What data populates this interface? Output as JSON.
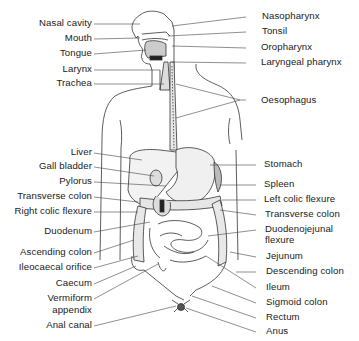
{
  "figure": {
    "left_labels": [
      {
        "text": "Nasal cavity",
        "y": 17
      },
      {
        "text": "Mouth",
        "y": 32
      },
      {
        "text": "Tongue",
        "y": 47
      },
      {
        "text": "Larynx",
        "y": 63
      },
      {
        "text": "Trachea",
        "y": 77
      },
      {
        "text": "Liver",
        "y": 146
      },
      {
        "text": "Gall bladder",
        "y": 160
      },
      {
        "text": "Pylorus",
        "y": 175
      },
      {
        "text": "Transverse colon",
        "y": 190
      },
      {
        "text": "Right colic flexure",
        "y": 205
      },
      {
        "text": "Duodenum",
        "y": 225
      },
      {
        "text": "Ascending colon",
        "y": 246
      },
      {
        "text": "Ileocaecal orifice",
        "y": 261
      },
      {
        "text": "Caecum",
        "y": 277
      },
      {
        "text": "Vermiform",
        "y": 292
      },
      {
        "text": "appendix",
        "y": 304
      },
      {
        "text": "Anal canal",
        "y": 319
      }
    ],
    "right_labels": [
      {
        "text": "Nasopharynx",
        "y": 10
      },
      {
        "text": "Tonsil",
        "y": 25
      },
      {
        "text": "Oropharynx",
        "y": 41
      },
      {
        "text": "Laryngeal pharynx",
        "y": 56
      },
      {
        "text": "Oesophagus",
        "y": 94
      },
      {
        "text": "Stomach",
        "y": 158
      },
      {
        "text": "Spleen",
        "y": 178
      },
      {
        "text": "Left colic flexure",
        "y": 193
      },
      {
        "text": "Transverse colon",
        "y": 208
      },
      {
        "text": "Duodenojejunal",
        "y": 223
      },
      {
        "text": "flexure",
        "y": 234
      },
      {
        "text": "Jejunum",
        "y": 250
      },
      {
        "text": "Descending colon",
        "y": 265
      },
      {
        "text": "Ileum",
        "y": 281
      },
      {
        "text": "Sigmoid colon",
        "y": 296
      },
      {
        "text": "Rectum",
        "y": 311
      },
      {
        "text": "Anus",
        "y": 325
      }
    ]
  }
}
